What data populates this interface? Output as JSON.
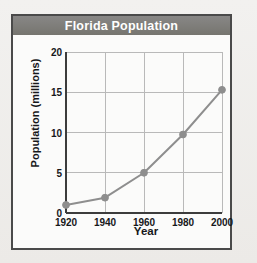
{
  "figure": {
    "title": "Florida Population"
  },
  "chart_data": {
    "type": "line",
    "title": "Florida Population",
    "xlabel": "Year",
    "ylabel": "Population (millions)",
    "x": [
      1920,
      1940,
      1960,
      1980,
      2000
    ],
    "values": [
      1.0,
      1.9,
      5.0,
      9.75,
      15.3
    ],
    "series": [
      {
        "name": "Florida Population",
        "values": [
          1.0,
          1.9,
          5.0,
          9.75,
          15.3
        ]
      }
    ],
    "xticks": [
      "1920",
      "1940",
      "1960",
      "1980",
      "2000"
    ],
    "yticks": [
      "0",
      "5",
      "10",
      "15",
      "20"
    ],
    "xlim": [
      1920,
      2000
    ],
    "ylim": [
      0,
      20
    ],
    "grid": true,
    "legend": false,
    "colors": {
      "line": "#8e8e8e",
      "marker": "#8e8e8e",
      "grid": "#b9b9b9",
      "axis": "#3c3c3c",
      "title_band": "#7d7c77",
      "title_text": "#ffffff",
      "plot_background": "#fbfbfa"
    }
  }
}
